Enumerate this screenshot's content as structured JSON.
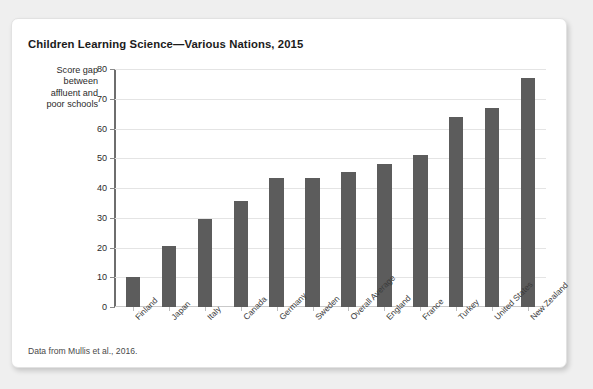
{
  "figure": {
    "title": "Children Learning Science—Various Nations, 2015",
    "source_note": "Data from Mullis et al., 2016.",
    "corner_mark": "",
    "bar_color": "#5c5c5c",
    "grid_color": "#e4e4e4",
    "axis_color": "#6e6e6e",
    "card_background": "#ffffff",
    "page_background": "#efefef"
  },
  "axis_caption": {
    "lines": [
      "Score gap",
      "between",
      "affluent and",
      "poor schools"
    ]
  },
  "chart_data": {
    "type": "bar",
    "title": "Children Learning Science—Various Nations, 2015",
    "xlabel": "",
    "ylabel": "Score gap between affluent and poor schools",
    "ylim": [
      0,
      80
    ],
    "yticks": [
      0,
      10,
      20,
      30,
      40,
      50,
      60,
      70,
      80
    ],
    "grid": true,
    "legend": null,
    "categories": [
      "Finland",
      "Japan",
      "Italy",
      "Canada",
      "Germany",
      "Sweden",
      "Overall Average",
      "England",
      "France",
      "Turkey",
      "United States",
      "New Zealand"
    ],
    "values": [
      10,
      20.5,
      29.5,
      35.5,
      43.5,
      43.5,
      45.5,
      48,
      51,
      64,
      67,
      77
    ],
    "annotation": "Data from Mullis et al., 2016."
  }
}
